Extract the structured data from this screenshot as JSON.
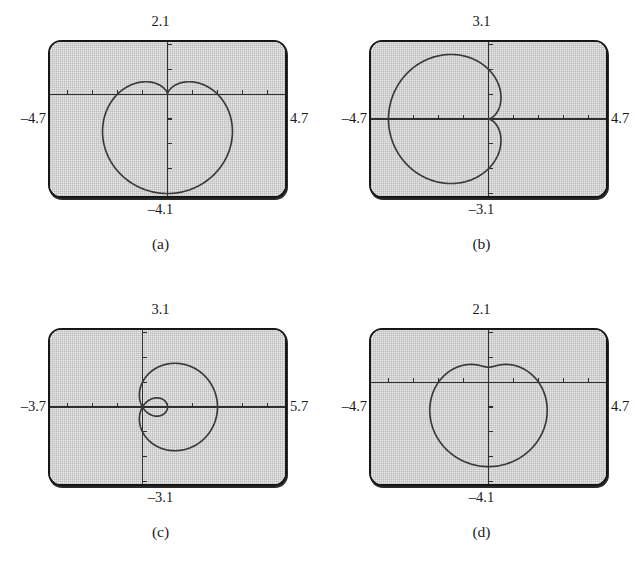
{
  "figure": {
    "panel_count": 4
  },
  "panels": [
    {
      "id": "a",
      "caption": "(a)",
      "labels": {
        "top": "2.1",
        "bottom": "–4.1",
        "left": "–4.7",
        "right": "4.7"
      },
      "window": {
        "xmin": -4.7,
        "xmax": 4.7,
        "ymin": -4.1,
        "ymax": 2.1
      },
      "tick_step": 1,
      "curve_color": "#3a3a3a",
      "curve_kind": "cardioid-down"
    },
    {
      "id": "b",
      "caption": "(b)",
      "labels": {
        "top": "3.1",
        "bottom": "–3.1",
        "left": "–4.7",
        "right": "4.7"
      },
      "window": {
        "xmin": -4.7,
        "xmax": 4.7,
        "ymin": -3.1,
        "ymax": 3.1
      },
      "tick_step": 1,
      "curve_color": "#3a3a3a",
      "curve_kind": "cardioid-left"
    },
    {
      "id": "c",
      "caption": "(c)",
      "labels": {
        "top": "3.1",
        "bottom": "–3.1",
        "left": "–3.7",
        "right": "5.7"
      },
      "window": {
        "xmin": -3.7,
        "xmax": 5.7,
        "ymin": -3.1,
        "ymax": 3.1
      },
      "tick_step": 1,
      "curve_color": "#3a3a3a",
      "curve_kind": "limacon-inner-loop-right"
    },
    {
      "id": "d",
      "caption": "(d)",
      "labels": {
        "top": "2.1",
        "bottom": "–4.1",
        "left": "–4.7",
        "right": "4.7"
      },
      "window": {
        "xmin": -4.7,
        "xmax": 4.7,
        "ymin": -4.1,
        "ymax": 2.1
      },
      "tick_step": 1,
      "curve_color": "#3a3a3a",
      "curve_kind": "dimpled-limacon-down"
    }
  ],
  "chart_data": [
    {
      "type": "line",
      "id": "a",
      "title": "(a)",
      "coordinate_system": "polar",
      "equation": "r = 2(1 - sin θ)",
      "xlabel": "",
      "ylabel": "",
      "xlim": [
        -4.7,
        4.7
      ],
      "ylim": [
        -4.1,
        2.1
      ],
      "xticks": [
        -4,
        -3,
        -2,
        -1,
        1,
        2,
        3,
        4
      ],
      "yticks": [
        -4,
        -3,
        -2,
        -1,
        1,
        2
      ],
      "grid": false,
      "legend": "none",
      "axis_labels_shown": {
        "top": "2.1",
        "bottom": "–4.1",
        "left": "–4.7",
        "right": "4.7"
      },
      "notes": "Cardioid with cusp at the origin opening downward; minimum y about -4, maximum |x| about 2.6",
      "series": [
        {
          "name": "r = 2(1 - sin θ)",
          "polar_r_of_theta": {
            "a": 2,
            "b": 2,
            "form": "a - b*sin(theta)"
          },
          "points_xy": [
            [
              0.0,
              0.0
            ],
            [
              0.37,
              -0.13
            ],
            [
              0.75,
              -0.27
            ],
            [
              1.13,
              -0.45
            ],
            [
              1.5,
              -0.69
            ],
            [
              1.85,
              -1.0
            ],
            [
              2.15,
              -1.37
            ],
            [
              2.4,
              -1.8
            ],
            [
              2.56,
              -2.27
            ],
            [
              2.62,
              -2.76
            ],
            [
              2.57,
              -3.23
            ],
            [
              2.39,
              -3.62
            ],
            [
              2.08,
              -3.89
            ],
            [
              1.65,
              -4.0
            ],
            [
              1.13,
              -3.94
            ],
            [
              0.57,
              -3.7
            ],
            [
              0.0,
              -3.33
            ],
            [
              -0.57,
              -3.7
            ],
            [
              -1.13,
              -3.94
            ],
            [
              -1.65,
              -4.0
            ],
            [
              -2.08,
              -3.89
            ],
            [
              -2.39,
              -3.62
            ],
            [
              -2.57,
              -3.23
            ],
            [
              -2.62,
              -2.76
            ],
            [
              -2.56,
              -2.27
            ],
            [
              -2.4,
              -1.8
            ],
            [
              -2.15,
              -1.37
            ],
            [
              -1.85,
              -1.0
            ],
            [
              -1.5,
              -0.69
            ],
            [
              -1.13,
              -0.45
            ],
            [
              -0.75,
              -0.27
            ],
            [
              -0.37,
              -0.13
            ],
            [
              0.0,
              0.0
            ]
          ]
        }
      ]
    },
    {
      "type": "line",
      "id": "b",
      "title": "(b)",
      "coordinate_system": "polar",
      "equation": "r = 2(1 - cos θ)",
      "xlabel": "",
      "ylabel": "",
      "xlim": [
        -4.7,
        4.7
      ],
      "ylim": [
        -3.1,
        3.1
      ],
      "xticks": [
        -4,
        -3,
        -2,
        -1,
        1,
        2,
        3,
        4
      ],
      "yticks": [
        -3,
        -2,
        -1,
        1,
        2,
        3
      ],
      "grid": false,
      "legend": "none",
      "axis_labels_shown": {
        "top": "3.1",
        "bottom": "–3.1",
        "left": "–4.7",
        "right": "4.7"
      },
      "notes": "Cardioid with cusp at origin opening to the left; leftmost x about -4, vertical extent about ±2.6",
      "series": [
        {
          "name": "r = 2(1 - cos θ)",
          "polar_r_of_theta": {
            "a": 2,
            "b": 2,
            "form": "a - b*cos(theta)"
          },
          "points_xy": [
            [
              0.0,
              0.0
            ],
            [
              0.13,
              0.37
            ],
            [
              0.27,
              0.75
            ],
            [
              0.45,
              1.13
            ],
            [
              0.69,
              1.5
            ],
            [
              1.0,
              1.85
            ],
            [
              1.37,
              2.15
            ],
            [
              1.8,
              2.4
            ],
            [
              2.27,
              2.56
            ],
            [
              2.76,
              2.62
            ],
            [
              3.23,
              2.57
            ],
            [
              3.62,
              2.39
            ],
            [
              3.89,
              2.08
            ],
            [
              4.0,
              1.65
            ],
            [
              3.94,
              1.13
            ],
            [
              3.7,
              0.57
            ],
            [
              3.33,
              0.0
            ],
            [
              3.7,
              -0.57
            ],
            [
              3.94,
              -1.13
            ],
            [
              4.0,
              -1.65
            ],
            [
              3.89,
              -2.08
            ],
            [
              3.62,
              -2.39
            ],
            [
              3.23,
              -2.57
            ],
            [
              2.76,
              -2.62
            ],
            [
              2.27,
              -2.56
            ],
            [
              1.8,
              -2.4
            ],
            [
              1.37,
              -2.15
            ],
            [
              1.0,
              -1.85
            ],
            [
              0.69,
              -1.5
            ],
            [
              0.45,
              -1.13
            ],
            [
              0.27,
              -0.75
            ],
            [
              0.13,
              -0.37
            ],
            [
              0.0,
              0.0
            ]
          ],
          "x_mirrored": true
        }
      ]
    },
    {
      "type": "line",
      "id": "c",
      "title": "(c)",
      "coordinate_system": "polar",
      "equation": "r = 1 + 2 cos θ",
      "xlabel": "",
      "ylabel": "",
      "xlim": [
        -3.7,
        5.7
      ],
      "ylim": [
        -3.1,
        3.1
      ],
      "xticks": [
        -3,
        -2,
        -1,
        1,
        2,
        3,
        4,
        5
      ],
      "yticks": [
        -3,
        -2,
        -1,
        1,
        2,
        3
      ],
      "grid": false,
      "legend": "none",
      "axis_labels_shown": {
        "top": "3.1",
        "bottom": "–3.1",
        "left": "–3.7",
        "right": "5.7"
      },
      "notes": "Limaçon with an inner loop; large outer lobe extends right to about x = 4.6, small inner loop from origin out to about x = 1",
      "series": [
        {
          "name": "outer loop",
          "polar_r_of_theta": {
            "a": 1,
            "b": 2,
            "form": "a + b*cos(theta)"
          },
          "points_xy": [
            [
              3.0,
              0.0
            ],
            [
              2.92,
              0.55
            ],
            [
              2.7,
              1.07
            ],
            [
              2.36,
              1.52
            ],
            [
              1.92,
              1.88
            ],
            [
              1.43,
              2.1
            ],
            [
              0.92,
              2.19
            ],
            [
              0.43,
              2.14
            ],
            [
              0.0,
              1.95
            ],
            [
              -0.36,
              1.66
            ],
            [
              -0.62,
              1.3
            ],
            [
              -0.76,
              0.92
            ],
            [
              -0.79,
              0.55
            ],
            [
              -0.72,
              0.24
            ],
            [
              -0.58,
              0.0
            ],
            [
              -0.72,
              -0.24
            ],
            [
              -0.79,
              -0.55
            ],
            [
              -0.76,
              -0.92
            ],
            [
              -0.62,
              -1.3
            ],
            [
              -0.36,
              -1.66
            ],
            [
              0.0,
              -1.95
            ],
            [
              0.43,
              -2.14
            ],
            [
              0.92,
              -2.19
            ],
            [
              1.43,
              -2.1
            ],
            [
              1.92,
              -1.88
            ],
            [
              2.36,
              -1.52
            ],
            [
              2.7,
              -1.07
            ],
            [
              2.92,
              -0.55
            ],
            [
              3.0,
              0.0
            ]
          ]
        },
        {
          "name": "inner loop",
          "points_xy": [
            [
              1.0,
              0.0
            ],
            [
              0.92,
              0.2
            ],
            [
              0.72,
              0.33
            ],
            [
              0.46,
              0.37
            ],
            [
              0.21,
              0.28
            ],
            [
              0.03,
              0.1
            ],
            [
              0.0,
              0.0
            ],
            [
              0.03,
              -0.1
            ],
            [
              0.21,
              -0.28
            ],
            [
              0.46,
              -0.37
            ],
            [
              0.72,
              -0.33
            ],
            [
              0.92,
              -0.2
            ],
            [
              1.0,
              0.0
            ]
          ]
        }
      ]
    },
    {
      "type": "line",
      "id": "d",
      "title": "(d)",
      "coordinate_system": "polar",
      "equation": "r = 2 - sin θ  (dimpled limaçon)",
      "xlabel": "",
      "ylabel": "",
      "xlim": [
        -4.7,
        4.7
      ],
      "ylim": [
        -4.1,
        2.1
      ],
      "xticks": [
        -4,
        -3,
        -2,
        -1,
        1,
        2,
        3,
        4
      ],
      "yticks": [
        -4,
        -3,
        -2,
        -1,
        1,
        2
      ],
      "grid": false,
      "legend": "none",
      "axis_labels_shown": {
        "top": "2.1",
        "bottom": "–4.1",
        "left": "–4.7",
        "right": "4.7"
      },
      "notes": "Dimpled limaçon opening downward; shallow dimple near y = +0.6 at top, bottom about y = -2.9, width about ±2.1",
      "series": [
        {
          "name": "r = 2 - sin θ",
          "polar_r_of_theta": {
            "a": 2,
            "b": 1,
            "form": "a - b*sin(theta)"
          },
          "points_xy": [
            [
              0.0,
              0.62
            ],
            [
              0.39,
              0.58
            ],
            [
              0.76,
              0.46
            ],
            [
              1.09,
              0.27
            ],
            [
              1.37,
              0.02
            ],
            [
              1.59,
              -0.29
            ],
            [
              1.76,
              -0.64
            ],
            [
              1.88,
              -1.02
            ],
            [
              1.95,
              -1.42
            ],
            [
              1.96,
              -1.82
            ],
            [
              1.9,
              -2.2
            ],
            [
              1.76,
              -2.52
            ],
            [
              1.53,
              -2.77
            ],
            [
              1.21,
              -2.92
            ],
            [
              0.83,
              -2.98
            ],
            [
              0.42,
              -2.99
            ],
            [
              0.0,
              -3.0
            ],
            [
              -0.42,
              -2.99
            ],
            [
              -0.83,
              -2.98
            ],
            [
              -1.21,
              -2.92
            ],
            [
              -1.53,
              -2.77
            ],
            [
              -1.76,
              -2.52
            ],
            [
              -1.9,
              -2.2
            ],
            [
              -1.96,
              -1.82
            ],
            [
              -1.95,
              -1.42
            ],
            [
              -1.88,
              -1.02
            ],
            [
              -1.76,
              -0.64
            ],
            [
              -1.59,
              -0.29
            ],
            [
              -1.37,
              0.02
            ],
            [
              -1.09,
              0.27
            ],
            [
              -0.76,
              0.46
            ],
            [
              -0.39,
              0.58
            ],
            [
              0.0,
              0.62
            ]
          ]
        }
      ]
    }
  ]
}
